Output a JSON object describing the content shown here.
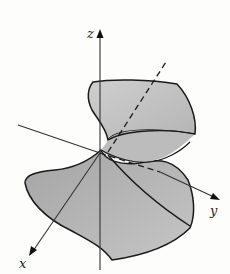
{
  "figure": {
    "colors": {
      "background": "#fdfdfb",
      "surface_light": "#c4c4c4",
      "surface_dark": "#a9a9a9",
      "outline": "#1a1a1a",
      "axis": "#333333"
    }
  },
  "axes": {
    "x": {
      "label": "x"
    },
    "y": {
      "label": "y"
    },
    "z": {
      "label": "z"
    }
  }
}
